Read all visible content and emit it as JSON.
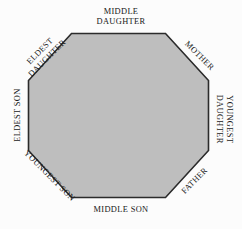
{
  "figure": {
    "shape": "octagon",
    "fill_color": "#bebebe",
    "border_color": "#2b2b2b",
    "background_color": "#fcfcfc",
    "text_color": "#171717"
  },
  "labels": {
    "top": {
      "name": "middle-daughter",
      "line1": "MIDDLE",
      "line2": "DAUGHTER"
    },
    "top_right": {
      "name": "mother",
      "line1": "MOTHER"
    },
    "right": {
      "name": "youngest-daughter",
      "line1": "YOUNGEST",
      "line2": "DAUGHTER"
    },
    "bottom_right": {
      "name": "father",
      "line1": "FATHER"
    },
    "bottom": {
      "name": "middle-son",
      "line1": "MIDDLE SON"
    },
    "bottom_left": {
      "name": "youngest-son",
      "line1": "YOUNGEST SON"
    },
    "left": {
      "name": "eldest-son",
      "line1": "ELDEST SON"
    },
    "top_left": {
      "name": "eldest-daughter",
      "line1": "ELDEST",
      "line2": "DAUGHTER"
    }
  }
}
